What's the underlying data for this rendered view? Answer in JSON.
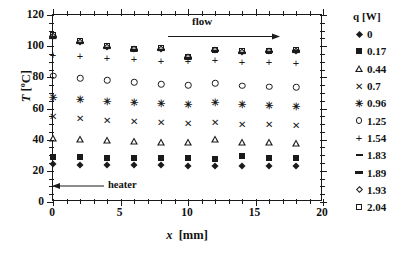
{
  "chart_data": {
    "type": "scatter",
    "title": "",
    "xlabel": "x [mm]",
    "ylabel": "T [°C]",
    "xlim": [
      0,
      20
    ],
    "ylim": [
      0,
      120
    ],
    "xticks": [
      "0",
      "5",
      "10",
      "15",
      "20"
    ],
    "xtick_values": [
      0,
      5,
      10,
      15,
      20
    ],
    "yticks": [
      "0",
      "20",
      "40",
      "60",
      "80",
      "100",
      "120"
    ],
    "ytick_values": [
      0,
      20,
      40,
      60,
      80,
      100,
      120
    ],
    "x_minor_step": 1,
    "y_minor_step": 5,
    "grid": false,
    "legend_position": "right",
    "legend_title": "q [W]",
    "x": [
      0,
      2,
      4,
      6,
      8,
      10,
      12,
      14,
      16,
      18
    ],
    "annotations": [
      {
        "name": "flow",
        "label": "flow",
        "type": "arrow-right"
      },
      {
        "name": "heater",
        "label": "heater",
        "type": "arrow-left"
      }
    ],
    "series": [
      {
        "name": "0",
        "marker": "diamond-filled",
        "values": [
          24.5,
          24.0,
          23.8,
          23.6,
          23.5,
          23.4,
          23.3,
          23.2,
          23.2,
          23.1
        ]
      },
      {
        "name": "0.17",
        "marker": "square-filled",
        "values": [
          29.0,
          28.7,
          28.5,
          28.3,
          28.2,
          28.0,
          27.9,
          29.8,
          28.5,
          28.3
        ]
      },
      {
        "name": "0.44",
        "marker": "triangle-open",
        "values": [
          41.0,
          40.2,
          39.6,
          39.2,
          38.7,
          38.3,
          40.2,
          38.6,
          38.3,
          38.0
        ]
      },
      {
        "name": "0.7",
        "marker": "cross",
        "values": [
          54.5,
          53.0,
          52.0,
          51.2,
          50.4,
          49.8,
          51.0,
          49.6,
          49.2,
          48.8
        ]
      },
      {
        "name": "0.96",
        "marker": "star",
        "values": [
          67.0,
          65.3,
          64.2,
          63.4,
          62.6,
          62.0,
          63.4,
          62.0,
          61.5,
          61.0
        ]
      },
      {
        "name": "1.25",
        "marker": "circle-open",
        "values": [
          81.0,
          79.5,
          78.0,
          76.8,
          75.6,
          74.8,
          76.2,
          74.6,
          74.0,
          73.5
        ]
      },
      {
        "name": "1.54",
        "marker": "plus",
        "values": [
          94.5,
          93.5,
          92.6,
          91.8,
          90.8,
          90.2,
          91.4,
          90.0,
          89.6,
          89.2
        ]
      },
      {
        "name": "1.83",
        "marker": "dash-small",
        "values": [
          105.0,
          101.8,
          98.6,
          97.2,
          97.4,
          92.0,
          96.6,
          95.4,
          96.0,
          96.2
        ]
      },
      {
        "name": "1.89",
        "marker": "dash-large",
        "values": [
          106.0,
          102.2,
          99.0,
          97.6,
          97.8,
          92.4,
          97.0,
          95.8,
          96.4,
          96.6
        ]
      },
      {
        "name": "1.93",
        "marker": "diamond-open",
        "values": [
          106.8,
          102.6,
          99.4,
          98.0,
          98.2,
          92.8,
          97.4,
          96.2,
          96.8,
          97.0
        ]
      },
      {
        "name": "2.04",
        "marker": "square-open",
        "values": [
          107.4,
          103.0,
          99.8,
          98.4,
          98.6,
          93.2,
          97.8,
          96.6,
          97.2,
          97.4
        ]
      }
    ],
    "legend_entries": [
      {
        "marker": "diamond-filled",
        "label": "0"
      },
      {
        "marker": "square-filled",
        "label": "0.17"
      },
      {
        "marker": "triangle-open",
        "label": "0.44"
      },
      {
        "marker": "cross",
        "label": "0.7"
      },
      {
        "marker": "star",
        "label": "0.96"
      },
      {
        "marker": "circle-open",
        "label": "1.25"
      },
      {
        "marker": "plus",
        "label": "1.54"
      },
      {
        "marker": "dash-small",
        "label": "1.83"
      },
      {
        "marker": "dash-large",
        "label": "1.89"
      },
      {
        "marker": "diamond-open",
        "label": "1.93"
      },
      {
        "marker": "square-open",
        "label": "2.04"
      }
    ],
    "colors": {
      "marker": "#1a1a1a",
      "axis": "#1a1a1a",
      "background": "#ffffff"
    }
  },
  "axis_titles": {
    "y_symbol": "T",
    "y_unit": "[°C]",
    "x_symbol": "x",
    "x_unit": "[mm]"
  }
}
